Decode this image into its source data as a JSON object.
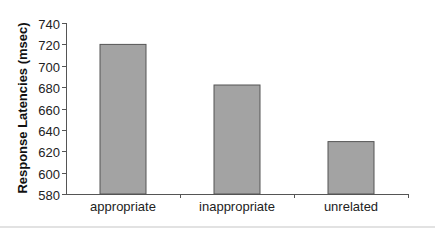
{
  "chart_data": {
    "type": "bar",
    "title": "",
    "xlabel": "",
    "ylabel": "Response Latencies (msec)",
    "categories": [
      "appropriate",
      "inappropriate",
      "unrelated"
    ],
    "values": [
      720,
      682,
      629
    ],
    "ylim": [
      580,
      740
    ],
    "yticks": [
      580,
      600,
      620,
      640,
      660,
      680,
      700,
      720,
      740
    ],
    "grid": false,
    "legend": null,
    "bar_color": "#a3a3a3",
    "bar_edge_color": "#555555",
    "axis_color": "#555555"
  }
}
